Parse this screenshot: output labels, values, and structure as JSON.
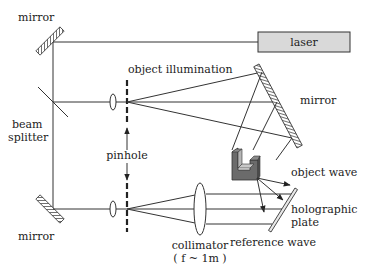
{
  "diagram": {
    "labels": {
      "mirror_top_left": "mirror",
      "laser": "laser",
      "object_illumination": "object illumination",
      "mirror_right": "mirror",
      "beam_splitter_line1": "beam",
      "beam_splitter_line2": "splitter",
      "pinhole": "pinhole",
      "object_wave": "object wave",
      "holographic_plate_line1": "holographic",
      "holographic_plate_line2": "plate",
      "mirror_bottom_left": "mirror",
      "collimator": "collimator",
      "collimator_focal": "( f ~ 1m )",
      "reference_wave": "reference wave"
    },
    "colors": {
      "line": "#333333",
      "laser_fill": "#d9d9d9",
      "object_dark": "#6b6b6b",
      "object_light": "#b5b5b5",
      "object_top": "#8a8a8a"
    }
  }
}
